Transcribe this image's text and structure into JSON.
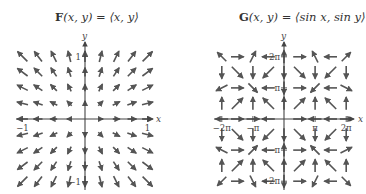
{
  "chart_data": [
    {
      "type": "vector-field",
      "title": "F(x, y) = ⟨x, y⟩",
      "title_bold": "F",
      "title_rest": "(x, y) = ⟨x, y⟩",
      "xlabel": "x",
      "ylabel": "y",
      "xlim": [
        -1,
        1
      ],
      "ylim": [
        -1,
        1
      ],
      "x_ticks": [
        {
          "value": -1,
          "label": "−1"
        },
        {
          "value": 1,
          "label": "1"
        }
      ],
      "y_ticks": [
        {
          "value": 1,
          "label": "1"
        },
        {
          "value": -1,
          "label": "−1"
        }
      ],
      "grid_step": 0.25,
      "field": "x,y",
      "arrow_color": "#555555"
    },
    {
      "type": "vector-field",
      "title": "G(x, y) = ⟨sin x, sin y⟩",
      "title_bold": "G",
      "title_rest": "(x, y) = ⟨sin x, sin y⟩",
      "xlabel": "x",
      "ylabel": "y",
      "xlim": [
        -6.2832,
        6.2832
      ],
      "ylim": [
        -6.2832,
        6.2832
      ],
      "x_ticks": [
        {
          "value": -6.2832,
          "label": "−2π"
        },
        {
          "value": -3.1416,
          "label": "−π"
        },
        {
          "value": 3.1416,
          "label": "π"
        },
        {
          "value": 6.2832,
          "label": "2π"
        }
      ],
      "y_ticks": [
        {
          "value": 6.2832,
          "label": "2π"
        },
        {
          "value": 3.1416,
          "label": "π"
        },
        {
          "value": -3.1416,
          "label": "−π"
        },
        {
          "value": -6.2832,
          "label": "−2π"
        }
      ],
      "grid_step": 1.5708,
      "field": "sin x,sin y",
      "arrow_color": "#555555"
    }
  ]
}
